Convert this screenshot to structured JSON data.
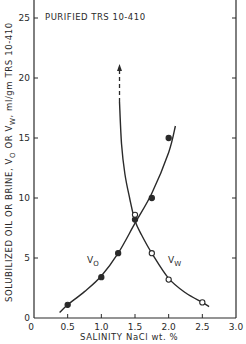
{
  "chart_data": {
    "type": "line",
    "title": "PURIFIED TRS 10-410",
    "xlabel": "SALINITY NaCl wt. %",
    "ylabel": "SOLUBILIZED OIL OR BRINE, V_O OR V_W, ml/gm TRS 10-410",
    "xlim": [
      0,
      3.0
    ],
    "ylim": [
      0,
      26.5
    ],
    "x_ticks": [
      "0",
      "0.5",
      "1.0",
      "1.5",
      "2.0",
      "2.5",
      "3.0"
    ],
    "y_ticks": [
      "0",
      "5",
      "10",
      "15",
      "20",
      "25"
    ],
    "grid": false,
    "legend": "inline labels",
    "series": [
      {
        "name": "V_O",
        "marker": "filled-circle",
        "x": [
          0.5,
          1.0,
          1.25,
          1.5,
          1.75,
          2.0
        ],
        "y": [
          1.1,
          3.4,
          5.4,
          8.2,
          10.0,
          15.0
        ],
        "curve": [
          [
            0.38,
            0.45
          ],
          [
            0.5,
            1.1
          ],
          [
            0.75,
            2.2
          ],
          [
            1.0,
            3.5
          ],
          [
            1.25,
            5.4
          ],
          [
            1.5,
            7.9
          ],
          [
            1.75,
            10.4
          ],
          [
            2.0,
            13.8
          ],
          [
            2.1,
            16.0
          ]
        ]
      },
      {
        "name": "V_W",
        "marker": "open-circle",
        "x": [
          1.5,
          1.75,
          2.0,
          2.5
        ],
        "y": [
          8.6,
          5.4,
          3.2,
          1.3
        ],
        "curve": [
          [
            1.27,
            18.0
          ],
          [
            1.3,
            14.5
          ],
          [
            1.35,
            12.0
          ],
          [
            1.42,
            10.0
          ],
          [
            1.5,
            8.1
          ],
          [
            1.6,
            6.9
          ],
          [
            1.75,
            5.4
          ],
          [
            2.0,
            3.3
          ],
          [
            2.25,
            2.1
          ],
          [
            2.5,
            1.3
          ],
          [
            2.6,
            0.95
          ]
        ],
        "asymptote_arrow": {
          "x": 1.27,
          "y_from": 18.0,
          "y_to": 21.0,
          "style": "dashed-with-arrow"
        }
      }
    ],
    "annotations": [
      {
        "text": "V_O",
        "x": 0.95,
        "y": 5.5
      },
      {
        "text": "V_W",
        "x": 1.95,
        "y": 5.5
      }
    ]
  },
  "labels": {
    "title": "PURIFIED TRS 10-410",
    "xlabel": "SALINITY  NaCl  wt. %",
    "ylabel": "SOLUBILIZED OIL OR BRINE, Vₒ OR Vᵂ, ml/gm  TRS 10-410",
    "vo": "V",
    "vo_sub": "O",
    "vw": "V",
    "vw_sub": "W",
    "origin_y": "0",
    "origin_x": "0"
  }
}
